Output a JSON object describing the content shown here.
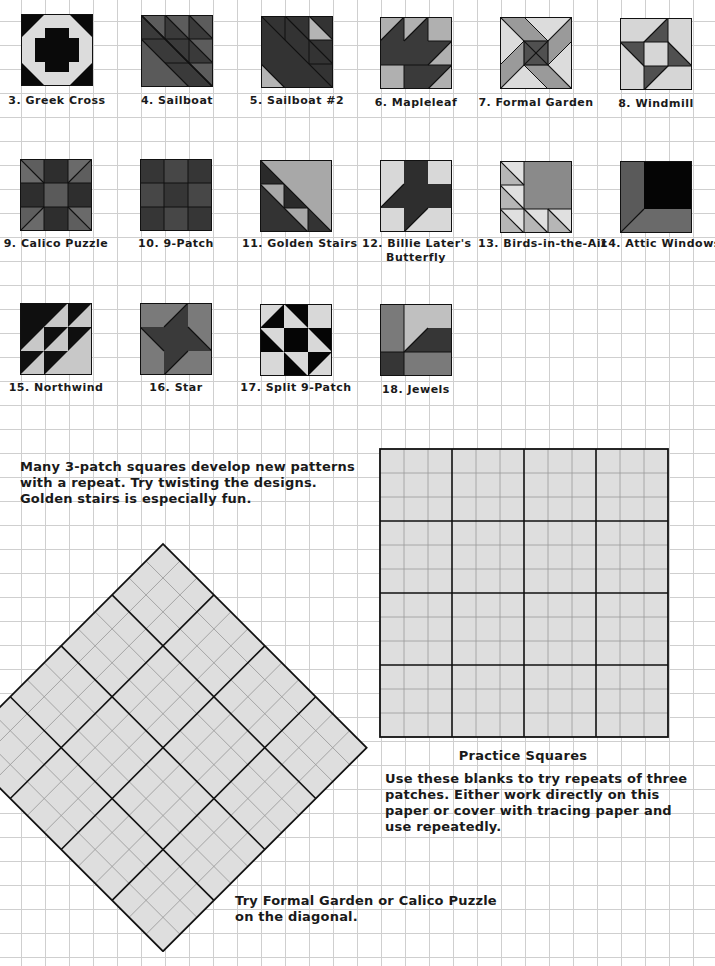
{
  "colors": {
    "dark": "#2b2b2b",
    "black": "#0a0a0a",
    "medium": "#6e6e6e",
    "mediumDark": "#505050",
    "light": "#b4b4b4",
    "pale": "#dcdcdc",
    "paper": "#ffffff",
    "gridLine": "#cfcfcf",
    "practiceFill": "#dedede"
  },
  "blocks": [
    {
      "id": "greek-cross",
      "label": "3.  Greek Cross"
    },
    {
      "id": "sailboat",
      "label": "4.  Sailboat"
    },
    {
      "id": "sailboat-2",
      "label": "5.  Sailboat #2"
    },
    {
      "id": "mapleleaf",
      "label": "6.  Mapleleaf"
    },
    {
      "id": "formal-garden",
      "label": "7.  Formal Garden"
    },
    {
      "id": "windmill",
      "label": "8.  Windmill"
    },
    {
      "id": "calico-puzzle",
      "label": "9.  Calico Puzzle"
    },
    {
      "id": "nine-patch",
      "label": "10.  9-Patch"
    },
    {
      "id": "golden-stairs",
      "label": "11.  Golden Stairs"
    },
    {
      "id": "billie-laters-butterfly",
      "label": "12.  Billie Later's",
      "label2": "Butterfly"
    },
    {
      "id": "birds-in-the-air",
      "label": "13.  Birds-in-the-Air"
    },
    {
      "id": "attic-windows",
      "label": "14.  Attic Windows"
    },
    {
      "id": "northwind",
      "label": "15.  Northwind"
    },
    {
      "id": "star",
      "label": "16.  Star"
    },
    {
      "id": "split-9-patch",
      "label": "17.  Split 9-Patch"
    },
    {
      "id": "jewels",
      "label": "18.  Jewels"
    }
  ],
  "notes": {
    "repeat_note": [
      "Many 3-patch squares develop new patterns",
      "with a repeat.  Try twisting the designs.",
      "Golden stairs is especially fun."
    ],
    "practice_title": "Practice Squares",
    "practice_note": [
      "Use these blanks to try repeats of three",
      "patches.  Either work directly on this",
      "paper or cover with tracing paper and",
      "use repeatedly."
    ],
    "diagonal_note": [
      "Try Formal Garden or Calico Puzzle",
      "on the diagonal."
    ]
  },
  "practice_grid": {
    "blocks_per_side": 4,
    "cells_per_block": 3,
    "cell_px": 24
  },
  "diagonal_grid": {
    "blocks_per_side": 4,
    "cells_per_block": 3,
    "cell_px": 24,
    "rotation_deg": 45
  }
}
